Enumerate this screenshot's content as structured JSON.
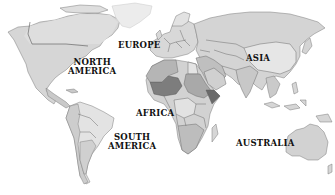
{
  "map": {
    "type": "world-political-map",
    "style": "grayscale",
    "labels": [
      {
        "id": "north-america",
        "line1": "NORTH",
        "line2": "AMERICA"
      },
      {
        "id": "europe",
        "line1": "EUROPE",
        "line2": ""
      },
      {
        "id": "asia",
        "line1": "ASIA",
        "line2": ""
      },
      {
        "id": "africa",
        "line1": "AFRICA",
        "line2": ""
      },
      {
        "id": "south-america",
        "line1": "SOUTH",
        "line2": "AMERICA"
      },
      {
        "id": "australia",
        "line1": "AUSTRALIA",
        "line2": ""
      }
    ],
    "colors": {
      "background": "#ffffff",
      "land_light": "#e2e2e2",
      "land_mid": "#cfcfcf",
      "land_dark": "#a8a8a8",
      "land_darkest": "#7c7c7c",
      "greenland": "#ececec",
      "border": "#6d6d6d"
    }
  }
}
